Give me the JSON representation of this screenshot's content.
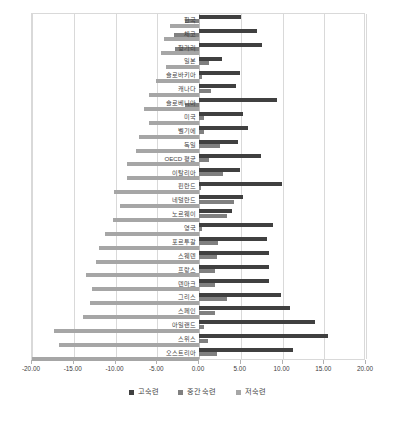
{
  "chart_data": {
    "type": "bar",
    "orientation": "horizontal",
    "title": "",
    "xlabel": "",
    "ylabel": "",
    "xlim": [
      -20,
      20
    ],
    "xticks": [
      -20,
      -15,
      -10,
      -5,
      0,
      5,
      10,
      15,
      20
    ],
    "xtick_labels": [
      "-20.00",
      "-15.00",
      "-10.00",
      "-5.00",
      "0.00",
      "5.00",
      "10.00",
      "15.00",
      "20.00"
    ],
    "grid": true,
    "grid_axis": "x",
    "legend_position": "bottom",
    "categories": [
      "한국",
      "체코",
      "헝가리",
      "일본",
      "슬로바키아",
      "캐나다",
      "슬로베니아",
      "미국",
      "벨기에",
      "독일",
      "OECD 평균",
      "이탈리아",
      "핀란드",
      "네덜란드",
      "노르웨이",
      "영국",
      "포르투갈",
      "스웨덴",
      "프랑스",
      "덴마크",
      "그리스",
      "스페인",
      "아일랜드",
      "스위스",
      "오스트리아"
    ],
    "series": [
      {
        "name": "고숙련",
        "color": "#404040",
        "values": [
          5.0,
          6.9,
          7.5,
          2.7,
          4.9,
          4.4,
          9.3,
          5.3,
          5.9,
          4.7,
          7.4,
          4.9,
          9.9,
          5.3,
          3.9,
          8.9,
          8.1,
          8.4,
          8.4,
          8.4,
          9.8,
          10.9,
          13.9,
          15.5,
          11.2
        ]
      },
      {
        "name": "중간 숙련",
        "color": "#808080",
        "values": [
          -1.7,
          -3.0,
          -2.9,
          1.2,
          0.3,
          1.4,
          -1.7,
          0.6,
          0.6,
          2.5,
          1.2,
          2.9,
          0.2,
          4.2,
          3.3,
          0.4,
          2.3,
          2.2,
          1.9,
          1.9,
          3.3,
          1.9,
          0.6,
          1.1,
          2.1
        ]
      },
      {
        "name": "저숙련",
        "color": "#a6a6a6",
        "values": [
          -3.5,
          -4.2,
          -4.6,
          -3.9,
          -5.1,
          -6.0,
          -6.6,
          -6.0,
          -7.2,
          -7.5,
          -8.6,
          -8.6,
          -10.2,
          -9.5,
          -10.3,
          -11.2,
          -12.0,
          -12.3,
          -13.5,
          -12.8,
          -13.1,
          -13.9,
          -17.4,
          -16.8,
          -20.0
        ]
      }
    ]
  },
  "legend": {
    "items": [
      {
        "label": "고숙련",
        "tone": "hi"
      },
      {
        "label": "중간 숙련",
        "tone": "mid"
      },
      {
        "label": "저숙련",
        "tone": "lo"
      }
    ]
  }
}
